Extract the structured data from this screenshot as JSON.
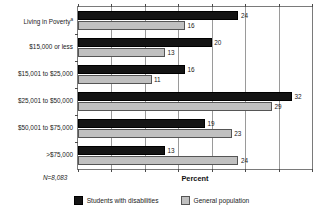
{
  "top_sliver_text": "",
  "chart_data": {
    "type": "bar",
    "orientation": "horizontal",
    "title": "",
    "xlabel": "Percent",
    "ylabel": "",
    "xlim": [
      0,
      35
    ],
    "xticks": [
      0,
      5,
      10,
      15,
      20,
      25,
      30,
      35
    ],
    "grid": true,
    "legend_position": "bottom",
    "note": "N=8,083",
    "footnote_marker": "a",
    "categories": [
      "Living in Poverty",
      "$15,000 or less",
      "$15,001 to $25,000",
      "$25,001 to $50,000",
      "$50,001 to $75,000",
      ">$75,000"
    ],
    "series": [
      {
        "name": "Students with disabilities",
        "color": "#141414",
        "values": [
          24,
          20,
          16,
          32,
          19,
          13
        ]
      },
      {
        "name": "General population",
        "color": "#c0c0c0",
        "values": [
          16,
          13,
          11,
          29,
          23,
          24
        ]
      }
    ]
  },
  "axis": {
    "categories": [
      {
        "label": "Living in Poverty",
        "superscript": "a"
      },
      {
        "label": "$15,000 or less",
        "superscript": ""
      },
      {
        "label": "$15,001 to $25,000",
        "superscript": ""
      },
      {
        "label": "$25,001 to $50,000",
        "superscript": ""
      },
      {
        "label": "$50,001 to $75,000",
        "superscript": ""
      },
      {
        "label": ">$75,000",
        "superscript": ""
      }
    ]
  },
  "labels": {
    "x_title": "Percent",
    "sample_size": "N=8,083"
  },
  "legend": {
    "items": [
      {
        "label": "Students with disabilities",
        "color": "#141414"
      },
      {
        "label": "General population",
        "color": "#c0c0c0"
      }
    ]
  }
}
